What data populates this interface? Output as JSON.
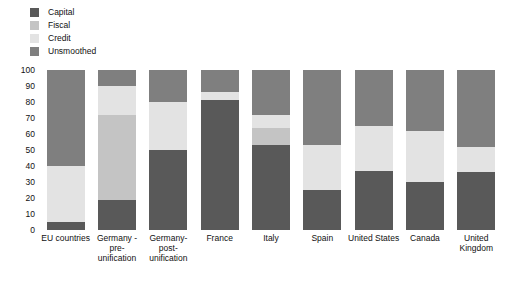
{
  "chart_data": {
    "type": "bar",
    "title": "",
    "subtitle": "",
    "xlabel": "",
    "ylabel": "",
    "ylim": [
      0,
      100
    ],
    "yticks": [
      100,
      90,
      80,
      70,
      60,
      50,
      40,
      30,
      20,
      10,
      0
    ],
    "grid": false,
    "stacked": true,
    "legend_position": "top-left",
    "categories": [
      "EU countries",
      "Germany - pre-unification",
      "Germany-post-unification",
      "France",
      "Italy",
      "Spain",
      "United States",
      "Canada",
      "United Kingdom"
    ],
    "category_lines": [
      [
        "EU countries"
      ],
      [
        "Germany -",
        "pre-",
        "unification"
      ],
      [
        "Germany-",
        "post-",
        "unification"
      ],
      [
        "France"
      ],
      [
        "Italy"
      ],
      [
        "Spain"
      ],
      [
        "United States"
      ],
      [
        "Canada"
      ],
      [
        "United",
        "Kingdom"
      ]
    ],
    "series": [
      {
        "name": "Capital",
        "color": "#595959",
        "values": [
          5,
          19,
          50,
          81,
          53,
          25,
          37,
          30,
          36
        ]
      },
      {
        "name": "Fiscal",
        "color": "#c4c4c4",
        "values": [
          0,
          53,
          0,
          0,
          11,
          0,
          0,
          0,
          0
        ]
      },
      {
        "name": "Credit",
        "color": "#e3e3e3",
        "values": [
          35,
          18,
          30,
          5,
          8,
          28,
          28,
          32,
          16
        ]
      },
      {
        "name": "Unsmoothed",
        "color": "#7f7f7f",
        "values": [
          60,
          10,
          20,
          14,
          28,
          47,
          35,
          38,
          48
        ]
      }
    ],
    "stack_boundaries": {
      "EU countries": {
        "capital": [
          0,
          5
        ],
        "fiscal": [
          5,
          5
        ],
        "credit": [
          5,
          40
        ],
        "unsmoothed": [
          40,
          100
        ]
      },
      "Germany - pre-unification": {
        "capital": [
          0,
          19
        ],
        "fiscal": [
          19,
          72
        ],
        "credit": [
          72,
          90
        ],
        "unsmoothed": [
          90,
          100
        ]
      },
      "Germany-post-unification": {
        "capital": [
          0,
          50
        ],
        "fiscal": [
          50,
          50
        ],
        "credit": [
          50,
          80
        ],
        "unsmoothed": [
          80,
          100
        ]
      },
      "France": {
        "capital": [
          0,
          81
        ],
        "fiscal": [
          81,
          81
        ],
        "credit": [
          81,
          86
        ],
        "unsmoothed": [
          86,
          100
        ]
      },
      "Italy": {
        "capital": [
          0,
          53
        ],
        "fiscal": [
          53,
          64
        ],
        "credit": [
          64,
          72
        ],
        "unsmoothed": [
          72,
          100
        ]
      },
      "Spain": {
        "capital": [
          0,
          25
        ],
        "fiscal": [
          25,
          25
        ],
        "credit": [
          25,
          53
        ],
        "unsmoothed": [
          53,
          100
        ]
      },
      "United States": {
        "capital": [
          0,
          37
        ],
        "fiscal": [
          37,
          37
        ],
        "credit": [
          37,
          65
        ],
        "unsmoothed": [
          65,
          100
        ]
      },
      "Canada": {
        "capital": [
          0,
          30
        ],
        "fiscal": [
          30,
          30
        ],
        "credit": [
          30,
          62
        ],
        "unsmoothed": [
          62,
          100
        ]
      },
      "United Kingdom": {
        "capital": [
          0,
          36
        ],
        "fiscal": [
          36,
          36
        ],
        "credit": [
          36,
          52
        ],
        "unsmoothed": [
          52,
          100
        ]
      }
    }
  },
  "legend": {
    "items": [
      {
        "label": "Capital",
        "color": "#595959"
      },
      {
        "label": "Fiscal",
        "color": "#c4c4c4"
      },
      {
        "label": "Credit",
        "color": "#e3e3e3"
      },
      {
        "label": "Unsmoothed",
        "color": "#7f7f7f"
      }
    ]
  }
}
